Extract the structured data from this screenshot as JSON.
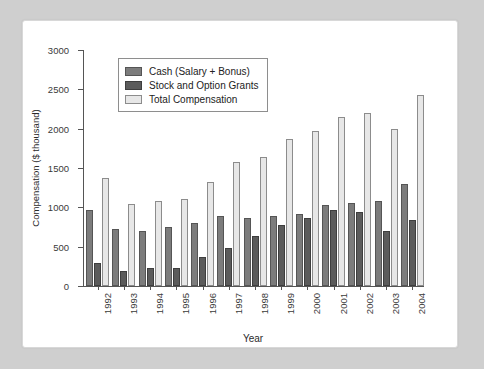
{
  "chart_data": {
    "type": "bar",
    "title": "",
    "xlabel": "Year",
    "ylabel": "Compensation ($ thousand)",
    "ylim": [
      0,
      3000
    ],
    "yticks": [
      0,
      500,
      1000,
      1500,
      2000,
      2500,
      3000
    ],
    "ytick_labels": [
      "0",
      "500",
      "1000",
      "1500",
      "2000",
      "2500",
      "3000"
    ],
    "grid": false,
    "legend_position": "upper left",
    "categories": [
      "1992",
      "1993",
      "1994",
      "1995",
      "1996",
      "1997",
      "1998",
      "1999",
      "2000",
      "2001",
      "2002",
      "2003",
      "2004"
    ],
    "series": [
      {
        "name": "Cash (Salary + Bonus)",
        "color": "#7c7c7c",
        "values": [
          965,
          725,
          705,
          745,
          795,
          890,
          870,
          890,
          910,
          1030,
          1050,
          1075,
          1300
        ]
      },
      {
        "name": "Stock and Option Grants",
        "color": "#5b5b5b",
        "values": [
          290,
          185,
          230,
          235,
          370,
          480,
          640,
          780,
          860,
          960,
          935,
          700,
          835
        ]
      },
      {
        "name": "Total Compensation",
        "color": "#e7e7e7",
        "values": [
          1370,
          1045,
          1085,
          1110,
          1325,
          1580,
          1645,
          1865,
          1975,
          2150,
          2200,
          2000,
          2430
        ]
      }
    ]
  },
  "legend": {
    "items": [
      {
        "label": "Cash (Salary + Bonus)",
        "swatch": "cash"
      },
      {
        "label": "Stock and Option Grants",
        "swatch": "stock"
      },
      {
        "label": "Total Compensation",
        "swatch": "total"
      }
    ]
  },
  "colors": {
    "cash": "#7c7c7c",
    "stock": "#5b5b5b",
    "total": "#e7e7e7",
    "axis": "#555555",
    "panel_background": "#ffffff",
    "page_background": "#cfcfcf"
  }
}
